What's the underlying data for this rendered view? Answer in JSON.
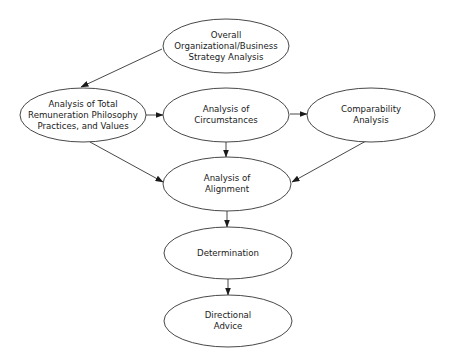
{
  "diagram": {
    "type": "flowchart",
    "stroke_color": "#333333",
    "fill_color": "#ffffff",
    "text_color": "#1a1a1a",
    "nodes": [
      {
        "id": "strategy",
        "label": "Overall\nOrganizational/Business\nStrategy Analysis",
        "cx": 226,
        "cy": 46,
        "rx": 63,
        "ry": 27
      },
      {
        "id": "total_remuneration",
        "label": "Analysis of Total\nRemuneration Philosophy\nPractices, and Values",
        "cx": 83,
        "cy": 115,
        "rx": 63,
        "ry": 27
      },
      {
        "id": "circumstances",
        "label": "Analysis of\nCircumstances",
        "cx": 226,
        "cy": 115,
        "rx": 63,
        "ry": 27
      },
      {
        "id": "comparability",
        "label": "Comparability\nAnalysis",
        "cx": 371,
        "cy": 115,
        "rx": 64,
        "ry": 27
      },
      {
        "id": "alignment",
        "label": "Analysis of\nAlignment",
        "cx": 227,
        "cy": 184,
        "rx": 64,
        "ry": 27
      },
      {
        "id": "determination",
        "label": "Determination",
        "cx": 228,
        "cy": 253,
        "rx": 64,
        "ry": 26
      },
      {
        "id": "directional_advice",
        "label": "Directional\nAdvice",
        "cx": 228,
        "cy": 321,
        "rx": 64,
        "ry": 26
      }
    ],
    "edges": [
      {
        "from": "strategy",
        "to": "total_remuneration",
        "x1": 162,
        "y1": 49,
        "x2": 81,
        "y2": 87
      },
      {
        "from": "total_remuneration",
        "to": "circumstances",
        "x1": 146,
        "y1": 115,
        "x2": 163,
        "y2": 115
      },
      {
        "from": "circumstances",
        "to": "comparability",
        "x1": 290,
        "y1": 114,
        "x2": 307,
        "y2": 114
      },
      {
        "from": "total_remuneration",
        "to": "alignment",
        "x1": 90,
        "y1": 142,
        "x2": 163,
        "y2": 182
      },
      {
        "from": "circumstances",
        "to": "alignment",
        "x1": 226,
        "y1": 142,
        "x2": 226,
        "y2": 157
      },
      {
        "from": "comparability",
        "to": "alignment",
        "x1": 366,
        "y1": 141,
        "x2": 292,
        "y2": 182
      },
      {
        "from": "alignment",
        "to": "determination",
        "x1": 227,
        "y1": 211,
        "x2": 227,
        "y2": 227
      },
      {
        "from": "determination",
        "to": "directional_advice",
        "x1": 228,
        "y1": 279,
        "x2": 228,
        "y2": 295
      }
    ]
  }
}
